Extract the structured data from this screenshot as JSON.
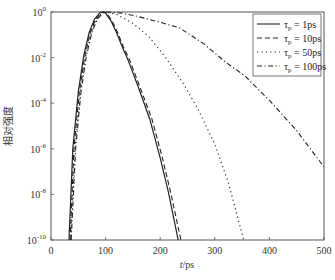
{
  "chart_data": {
    "type": "line",
    "title": "",
    "xlabel": "t/ps",
    "ylabel": "相对强度",
    "xscale": "linear",
    "yscale": "log",
    "xlim": [
      0,
      500
    ],
    "ylim": [
      1e-10,
      1
    ],
    "x_ticks": [
      0,
      100,
      200,
      300,
      400,
      500
    ],
    "x_tick_labels": [
      "0",
      "100",
      "200",
      "300",
      "400",
      "500"
    ],
    "y_ticks_log10": [
      0,
      -2,
      -4,
      -6,
      -8,
      -10
    ],
    "y_tick_labels": [
      {
        "base": "10",
        "exp": "0"
      },
      {
        "base": "10",
        "exp": "-2"
      },
      {
        "base": "10",
        "exp": "-4"
      },
      {
        "base": "10",
        "exp": "-6"
      },
      {
        "base": "10",
        "exp": "-8"
      },
      {
        "base": "10",
        "exp": "-10"
      }
    ],
    "grid": false,
    "legend_position": "upper right",
    "series": [
      {
        "name": "τp = 1ps",
        "legend": {
          "sym": "τ",
          "sub": "p",
          "rest": " = 1ps"
        },
        "style": "solid",
        "points": [
          [
            33,
            -10
          ],
          [
            40,
            -6
          ],
          [
            50,
            -3.5
          ],
          [
            60,
            -1.9
          ],
          [
            70,
            -0.9
          ],
          [
            80,
            -0.3
          ],
          [
            90,
            -0.03
          ],
          [
            95,
            0
          ],
          [
            100,
            -0.05
          ],
          [
            110,
            -0.4
          ],
          [
            120,
            -0.9
          ],
          [
            130,
            -1.5
          ],
          [
            141,
            -2.1
          ],
          [
            160,
            -3.3
          ],
          [
            181,
            -4.7
          ],
          [
            200,
            -6.4
          ],
          [
            215,
            -7.9
          ],
          [
            233,
            -10
          ]
        ]
      },
      {
        "name": "τp = 10ps",
        "legend": {
          "sym": "τ",
          "sub": "p",
          "rest": " = 10ps"
        },
        "style": "dashed",
        "points": [
          [
            35,
            -10
          ],
          [
            42,
            -6
          ],
          [
            52,
            -3.5
          ],
          [
            62,
            -1.9
          ],
          [
            72,
            -0.9
          ],
          [
            82,
            -0.3
          ],
          [
            92,
            -0.03
          ],
          [
            97,
            0
          ],
          [
            102,
            -0.05
          ],
          [
            112,
            -0.4
          ],
          [
            122,
            -0.9
          ],
          [
            132,
            -1.5
          ],
          [
            144,
            -2.1
          ],
          [
            163,
            -3.3
          ],
          [
            185,
            -4.7
          ],
          [
            204,
            -6.4
          ],
          [
            219,
            -7.9
          ],
          [
            238,
            -10
          ]
        ]
      },
      {
        "name": "τp = 50ps",
        "legend": {
          "sym": "τ",
          "sub": "p",
          "rest": " = 50ps"
        },
        "style": "dotted",
        "points": [
          [
            36,
            -10
          ],
          [
            44,
            -6
          ],
          [
            54,
            -3.5
          ],
          [
            64,
            -1.9
          ],
          [
            74,
            -0.9
          ],
          [
            84,
            -0.3
          ],
          [
            94,
            -0.03
          ],
          [
            100,
            0
          ],
          [
            120,
            -0.1
          ],
          [
            150,
            -0.5
          ],
          [
            180,
            -1.1
          ],
          [
            210,
            -2.0
          ],
          [
            244,
            -3.2
          ],
          [
            270,
            -4.3
          ],
          [
            300,
            -5.8
          ],
          [
            325,
            -7.5
          ],
          [
            353,
            -10
          ]
        ]
      },
      {
        "name": "τp = 100ps",
        "legend": {
          "sym": "τ",
          "sub": "p",
          "rest": " = 100ps"
        },
        "style": "dashdot",
        "points": [
          [
            37,
            -10
          ],
          [
            45,
            -6
          ],
          [
            55,
            -3.5
          ],
          [
            65,
            -1.9
          ],
          [
            75,
            -0.9
          ],
          [
            85,
            -0.3
          ],
          [
            96,
            -0.03
          ],
          [
            105,
            0
          ],
          [
            130,
            -0.05
          ],
          [
            160,
            -0.2
          ],
          [
            200,
            -0.45
          ],
          [
            236,
            -0.7
          ],
          [
            280,
            -1.4
          ],
          [
            320,
            -2.2
          ],
          [
            355,
            -2.8
          ],
          [
            401,
            -3.9
          ],
          [
            450,
            -5.2
          ],
          [
            500,
            -6.8
          ]
        ]
      }
    ]
  }
}
